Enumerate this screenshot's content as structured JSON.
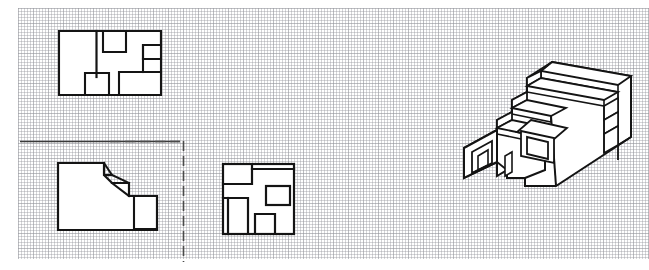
{
  "sheet": {
    "title": "Architectural Drawing Sheet",
    "background_color": "#ffffff",
    "grid_color": "#96989e",
    "line_color": "#141414",
    "width": 649,
    "height": 270
  },
  "drawings": [
    {
      "id": "upper-floor-plan",
      "name": "Upper Floor Plan",
      "type": "floor-plan",
      "position": {
        "x": 58,
        "y": 30,
        "width": 104,
        "height": 66
      },
      "description": "Rectangular plan with interior partition walls, a notched upper-right recess and two lower rooms"
    },
    {
      "id": "ground-floor-plan",
      "name": "Ground Floor Plan",
      "type": "floor-plan",
      "position": {
        "x": 57,
        "y": 162,
        "width": 101,
        "height": 69
      },
      "description": "Stepped diagonal plan with chamfered corner and small room at lower right"
    },
    {
      "id": "roof-plan",
      "name": "Roof Plan",
      "type": "floor-plan",
      "position": {
        "x": 222,
        "y": 163,
        "width": 73,
        "height": 72
      },
      "description": "Square plan with four inscribed rooms"
    },
    {
      "id": "axonometric-view",
      "name": "Axonometric View",
      "type": "axonometric",
      "position": {
        "x": 464,
        "y": 60,
        "width": 168,
        "height": 129
      },
      "description": "Isometric cutaway of a stepped building mass with terraces, a square window aperture and a projecting tunnel volume"
    }
  ],
  "guides": {
    "top_rule": {
      "name": "horizontal-guide-line",
      "x1": 20,
      "y1": 141,
      "x2": 183,
      "y2": 141,
      "style": "solid"
    },
    "right_rule": {
      "name": "vertical-guide-line",
      "x1": 183,
      "y1": 141,
      "x2": 183,
      "y2": 262,
      "style": "dashed"
    }
  }
}
